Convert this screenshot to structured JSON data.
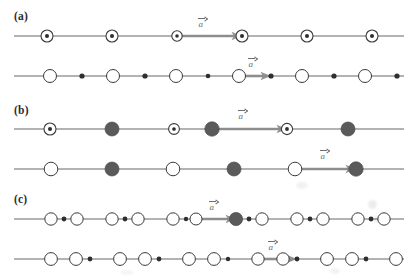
{
  "figure": {
    "width": 415,
    "height": 277,
    "background": "#ffffff",
    "line_color": "#555555",
    "arrow_color": "#8c8c8c",
    "open_circle_stroke": "#3a3a3a",
    "filled_circle_color": "#5a5a5a",
    "dot_color": "#2e2e2e",
    "label_color": "#2b2b2b",
    "vector_label_color": "#6e6e6e"
  },
  "panels": [
    {
      "id": "a",
      "label": "(a)",
      "label_x": 14,
      "label_y": 10,
      "rows": [
        {
          "id": "a1",
          "y": 36,
          "line_x1": 14,
          "line_x2": 404,
          "sites": [
            {
              "type": "ring-dot",
              "x": 47,
              "r": 6.0
            },
            {
              "type": "ring-dot",
              "x": 112,
              "r": 6.0
            },
            {
              "type": "ring-dot",
              "x": 177,
              "r": 5.2
            },
            {
              "type": "ring-dot",
              "x": 242,
              "r": 6.0
            },
            {
              "type": "ring-dot",
              "x": 307,
              "r": 6.0
            },
            {
              "type": "ring-dot",
              "x": 372,
              "r": 6.0
            }
          ],
          "vector": {
            "label": "a",
            "x1": 177,
            "x2": 242,
            "label_x": 198,
            "label_y": 16
          }
        },
        {
          "id": "a2",
          "y": 76,
          "line_x1": 14,
          "line_x2": 404,
          "sites": [
            {
              "type": "open",
              "x": 50,
              "r": 6.5
            },
            {
              "type": "dot",
              "x": 82,
              "r": 2.6
            },
            {
              "type": "open",
              "x": 113,
              "r": 6.5
            },
            {
              "type": "dot",
              "x": 145,
              "r": 2.6
            },
            {
              "type": "open",
              "x": 176,
              "r": 6.5
            },
            {
              "type": "dot",
              "x": 208,
              "r": 2.3
            },
            {
              "type": "open",
              "x": 239,
              "r": 6.5
            },
            {
              "type": "dot",
              "x": 271,
              "r": 2.6
            },
            {
              "type": "open",
              "x": 302,
              "r": 6.5
            },
            {
              "type": "dot",
              "x": 334,
              "r": 2.6
            },
            {
              "type": "open",
              "x": 365,
              "r": 6.5
            },
            {
              "type": "dot",
              "x": 397,
              "r": 2.6
            }
          ],
          "vector": {
            "label": "a",
            "x1": 239,
            "x2": 271,
            "label_x": 248,
            "label_y": 56
          }
        }
      ]
    },
    {
      "id": "b",
      "label": "(b)",
      "label_x": 14,
      "label_y": 104,
      "rows": [
        {
          "id": "b1",
          "y": 129,
          "line_x1": 14,
          "line_x2": 404,
          "sites": [
            {
              "type": "ring-dot",
              "x": 50,
              "r": 6.0
            },
            {
              "type": "filled",
              "x": 112,
              "r": 7.0
            },
            {
              "type": "ring-dot",
              "x": 174,
              "r": 5.4
            },
            {
              "type": "filled",
              "x": 212,
              "r": 7.2
            },
            {
              "type": "ring-dot",
              "x": 287,
              "r": 5.6
            },
            {
              "type": "filled",
              "x": 348,
              "r": 7.0
            }
          ],
          "vector": {
            "label": "a",
            "x1": 212,
            "x2": 287,
            "label_x": 238,
            "label_y": 108
          }
        },
        {
          "id": "b2",
          "y": 169,
          "line_x1": 14,
          "line_x2": 404,
          "sites": [
            {
              "type": "open",
              "x": 51,
              "r": 6.8
            },
            {
              "type": "filled",
              "x": 112,
              "r": 7.0
            },
            {
              "type": "open",
              "x": 173,
              "r": 6.8
            },
            {
              "type": "filled",
              "x": 234,
              "r": 7.0
            },
            {
              "type": "open",
              "x": 295,
              "r": 6.8
            },
            {
              "type": "filled",
              "x": 356,
              "r": 7.2
            }
          ],
          "vector": {
            "label": "a",
            "x1": 295,
            "x2": 356,
            "label_x": 320,
            "label_y": 148
          }
        }
      ]
    },
    {
      "id": "c",
      "label": "(c)",
      "label_x": 14,
      "label_y": 193,
      "rows": [
        {
          "id": "c1",
          "y": 219,
          "line_x1": 14,
          "line_x2": 404,
          "sites": [
            {
              "type": "open",
              "x": 51,
              "r": 6.2
            },
            {
              "type": "dot",
              "x": 64,
              "r": 2.4
            },
            {
              "type": "open",
              "x": 77,
              "r": 6.2
            },
            {
              "type": "open",
              "x": 112,
              "r": 6.2
            },
            {
              "type": "dot",
              "x": 125,
              "r": 2.4
            },
            {
              "type": "open",
              "x": 138,
              "r": 6.2
            },
            {
              "type": "open",
              "x": 173,
              "r": 6.2
            },
            {
              "type": "dot",
              "x": 186,
              "r": 2.2
            },
            {
              "type": "open",
              "x": 196,
              "r": 6.0
            },
            {
              "type": "filled",
              "x": 236,
              "r": 6.6
            },
            {
              "type": "dot",
              "x": 249,
              "r": 2.4
            },
            {
              "type": "open",
              "x": 262,
              "r": 6.2
            },
            {
              "type": "open",
              "x": 297,
              "r": 6.2
            },
            {
              "type": "dot",
              "x": 310,
              "r": 2.4
            },
            {
              "type": "open",
              "x": 323,
              "r": 6.2
            },
            {
              "type": "open",
              "x": 358,
              "r": 6.2
            },
            {
              "type": "dot",
              "x": 371,
              "r": 2.4
            },
            {
              "type": "open",
              "x": 384,
              "r": 6.2
            }
          ],
          "vector": {
            "label": "a",
            "x1": 196,
            "x2": 236,
            "label_x": 209,
            "label_y": 199
          }
        },
        {
          "id": "c2",
          "y": 259,
          "line_x1": 14,
          "line_x2": 404,
          "sites": [
            {
              "type": "open",
              "x": 51,
              "r": 6.4
            },
            {
              "type": "open",
              "x": 76,
              "r": 6.4
            },
            {
              "type": "dot",
              "x": 90,
              "r": 2.4
            },
            {
              "type": "open",
              "x": 120,
              "r": 6.4
            },
            {
              "type": "open",
              "x": 145,
              "r": 6.4
            },
            {
              "type": "dot",
              "x": 159,
              "r": 2.4
            },
            {
              "type": "open",
              "x": 189,
              "r": 6.4
            },
            {
              "type": "open",
              "x": 214,
              "r": 6.4
            },
            {
              "type": "dot",
              "x": 228,
              "r": 2.2
            },
            {
              "type": "open",
              "x": 258,
              "r": 6.2
            },
            {
              "type": "open",
              "x": 283,
              "r": 6.2
            },
            {
              "type": "dot",
              "x": 297,
              "r": 2.4
            },
            {
              "type": "open",
              "x": 327,
              "r": 6.4
            },
            {
              "type": "open",
              "x": 352,
              "r": 6.4
            },
            {
              "type": "dot",
              "x": 366,
              "r": 2.4
            },
            {
              "type": "open",
              "x": 396,
              "r": 6.4
            }
          ],
          "vector": {
            "label": "a",
            "x1": 258,
            "x2": 297,
            "label_x": 268,
            "label_y": 239
          }
        }
      ]
    }
  ]
}
